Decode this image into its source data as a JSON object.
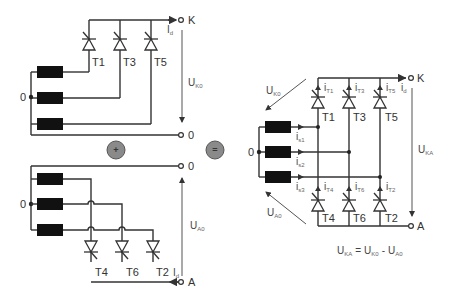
{
  "diagram": {
    "operators": {
      "plus": "+",
      "equals": "="
    },
    "upper_circuit": {
      "thyristors": [
        "T1",
        "T3",
        "T5"
      ],
      "terminal_top": "K",
      "terminal_bottom": "0",
      "neutral": "0",
      "current": {
        "main": "I",
        "sub": "d"
      },
      "voltage": {
        "main": "U",
        "sub": "K0"
      }
    },
    "lower_circuit": {
      "thyristors": [
        "T4",
        "T6",
        "T2"
      ],
      "terminal_top": "0",
      "terminal_bottom": "A",
      "neutral": "0",
      "current": {
        "main": "I",
        "sub": "d"
      },
      "voltage": {
        "main": "U",
        "sub": "A0"
      }
    },
    "bridge": {
      "thyristors_top": [
        "T1",
        "T3",
        "T5"
      ],
      "thyristors_bottom": [
        "T4",
        "T6",
        "T2"
      ],
      "thyristor_currents_top": [
        {
          "main": "i",
          "sub": "T1"
        },
        {
          "main": "i",
          "sub": "T3"
        },
        {
          "main": "i",
          "sub": "T5"
        }
      ],
      "thyristor_currents_bottom": [
        {
          "main": "i",
          "sub": "T4"
        },
        {
          "main": "i",
          "sub": "T6"
        },
        {
          "main": "i",
          "sub": "T2"
        }
      ],
      "phase_currents": [
        {
          "main": "i",
          "sub": "s1"
        },
        {
          "main": "i",
          "sub": "s2"
        },
        {
          "main": "i",
          "sub": "s3"
        }
      ],
      "terminal_top": "K",
      "terminal_bottom": "A",
      "neutral": "0",
      "current": {
        "main": "i",
        "sub": "d"
      },
      "voltage_total": {
        "main": "U",
        "sub": "KA"
      },
      "voltage_upper": {
        "main": "U",
        "sub": "K0"
      },
      "voltage_lower": {
        "main": "U",
        "sub": "A0"
      }
    },
    "equation": {
      "lhs": {
        "main": "U",
        "sub": "KA"
      },
      "eq": "=",
      "t1": {
        "main": "U",
        "sub": "K0"
      },
      "minus": "-",
      "t2": {
        "main": "U",
        "sub": "A0"
      }
    }
  }
}
